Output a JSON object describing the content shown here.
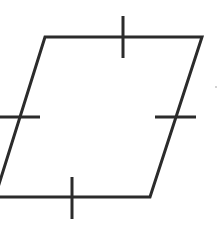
{
  "diagram": {
    "shape": "rhombus",
    "stroke_color": "#2b2b2b",
    "background": "#ffffff",
    "vertices": {
      "top_left": [
        45,
        37
      ],
      "top_right": [
        202,
        37
      ],
      "bottom_right": [
        150,
        197
      ],
      "bottom_left": [
        -5,
        197
      ]
    },
    "tick_marks": [
      {
        "side": "top",
        "x1": 123,
        "y1": 16,
        "x2": 123,
        "y2": 58
      },
      {
        "side": "right",
        "x1": 155,
        "y1": 117,
        "x2": 196,
        "y2": 117
      },
      {
        "side": "bottom",
        "x1": 72,
        "y1": 177,
        "x2": 72,
        "y2": 219
      },
      {
        "side": "left",
        "x1": 0,
        "y1": 117,
        "x2": 40,
        "y2": 117
      }
    ]
  }
}
